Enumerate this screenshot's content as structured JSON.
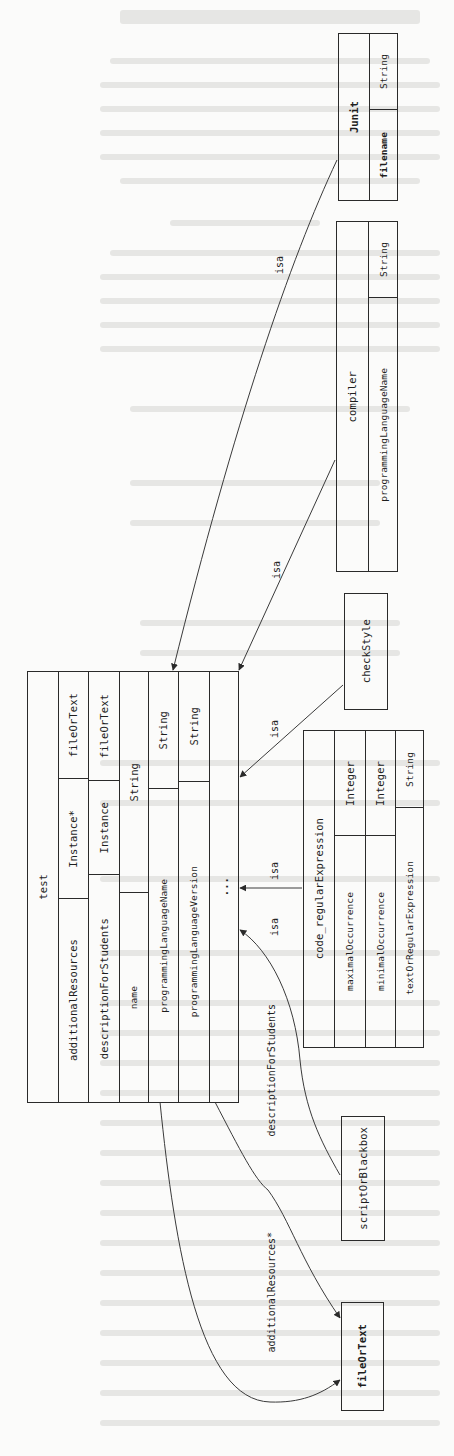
{
  "diagram": {
    "orientation": "rotated 90 degrees counter-clockwise",
    "nodes": {
      "junit": {
        "title": "Junit",
        "attributes": [
          {
            "name": "filename",
            "type": "String"
          }
        ]
      },
      "compiler": {
        "title": "compiler",
        "attributes": [
          {
            "name": "programmingLanguageName",
            "type": "String"
          }
        ]
      },
      "check_style": {
        "title": "checkStyle"
      },
      "code_regular_expression": {
        "title": "code_regularExpression",
        "attributes": [
          {
            "name": "maximalOccurrence",
            "type": "Integer"
          },
          {
            "name": "minimalOccurrence",
            "type": "Integer"
          },
          {
            "name": "textOrRegularExpression",
            "type": "String"
          }
        ]
      },
      "script_or_blackbox": {
        "title": "scriptOrBlackbox"
      },
      "file_or_text": {
        "title": "fileOrText"
      },
      "test": {
        "title": "test",
        "attributes": [
          {
            "name": "additionalResources",
            "type": "Instance*",
            "range": "fileOrText"
          },
          {
            "name": "descriptionForStudents",
            "type": "Instance",
            "range": "fileOrText"
          },
          {
            "name": "name",
            "type": "String"
          },
          {
            "name": "programmingLanguageName",
            "type": "String"
          },
          {
            "name": "programmingLanguageVersion",
            "type": "String"
          }
        ],
        "ellipsis": "..."
      }
    },
    "edges": [
      {
        "from": "Junit",
        "to": "test",
        "label": "isa"
      },
      {
        "from": "compiler",
        "to": "test",
        "label": "isa"
      },
      {
        "from": "checkStyle",
        "to": "test",
        "label": "isa"
      },
      {
        "from": "code_regularExpression",
        "to": "test",
        "label": "isa"
      },
      {
        "from": "scriptOrBlackbox",
        "to": "test",
        "label": "isa"
      },
      {
        "from": "test",
        "to": "fileOrText",
        "label": "descriptionForStudents"
      },
      {
        "from": "test",
        "to": "fileOrText",
        "label": "additionalResources*"
      }
    ],
    "edge_labels": {
      "isa": "isa",
      "description_for_students": "descriptionForStudents",
      "additional_resources": "additionalResources*"
    }
  }
}
